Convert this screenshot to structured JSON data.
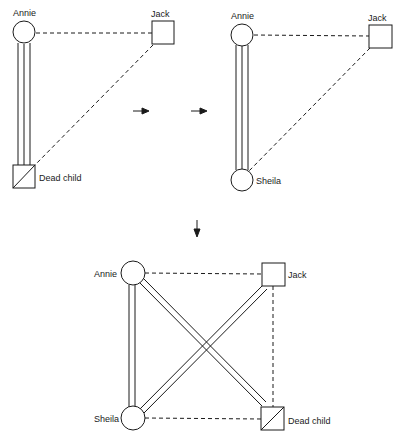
{
  "colors": {
    "ink": "#1a1a1a",
    "background": "#ffffff"
  },
  "diagrams": [
    {
      "id": "panel-1",
      "nodes": [
        {
          "label": "Annie",
          "shape": "circle",
          "gender": "female"
        },
        {
          "label": "Jack",
          "shape": "square",
          "gender": "male"
        },
        {
          "label": "Dead child",
          "shape": "square-crossed",
          "gender": "male",
          "deceased": true
        }
      ],
      "edges": [
        {
          "from": "Annie",
          "to": "Jack",
          "style": "dashed"
        },
        {
          "from": "Jack",
          "to": "Dead child",
          "style": "dashed"
        },
        {
          "from": "Annie",
          "to": "Dead child",
          "style": "triple-line"
        }
      ]
    },
    {
      "id": "panel-2",
      "nodes": [
        {
          "label": "Annie",
          "shape": "circle",
          "gender": "female"
        },
        {
          "label": "Jack",
          "shape": "square",
          "gender": "male"
        },
        {
          "label": "Sheila",
          "shape": "circle",
          "gender": "female"
        }
      ],
      "edges": [
        {
          "from": "Annie",
          "to": "Jack",
          "style": "dashed"
        },
        {
          "from": "Jack",
          "to": "Sheila",
          "style": "dashed"
        },
        {
          "from": "Annie",
          "to": "Sheila",
          "style": "triple-line"
        }
      ]
    },
    {
      "id": "panel-3",
      "nodes": [
        {
          "label": "Annie",
          "shape": "circle",
          "gender": "female"
        },
        {
          "label": "Jack",
          "shape": "square",
          "gender": "male"
        },
        {
          "label": "Sheila",
          "shape": "circle",
          "gender": "female"
        },
        {
          "label": "Dead child",
          "shape": "square-crossed",
          "gender": "male",
          "deceased": true
        }
      ],
      "edges": [
        {
          "from": "Annie",
          "to": "Jack",
          "style": "dashed"
        },
        {
          "from": "Jack",
          "to": "Dead child",
          "style": "dashed"
        },
        {
          "from": "Sheila",
          "to": "Dead child",
          "style": "dashed"
        },
        {
          "from": "Annie",
          "to": "Sheila",
          "style": "double-line"
        },
        {
          "from": "Annie",
          "to": "Dead child",
          "style": "double-line"
        },
        {
          "from": "Sheila",
          "to": "Jack",
          "style": "double-line"
        }
      ]
    }
  ],
  "arrows": [
    {
      "direction": "right",
      "between": "panel-1 → panel-2"
    },
    {
      "direction": "right",
      "between": "panel-1 → panel-2"
    },
    {
      "direction": "down",
      "between": "panel-2 → panel-3"
    }
  ],
  "labels": {
    "p1_annie": "Annie",
    "p1_jack": "Jack",
    "p1_dead_child": "Dead child",
    "p2_annie": "Annie",
    "p2_jack": "Jack",
    "p2_sheila": "Sheila",
    "p3_annie": "Annie",
    "p3_jack": "Jack",
    "p3_sheila": "Sheila",
    "p3_dead_child": "Dead child"
  }
}
